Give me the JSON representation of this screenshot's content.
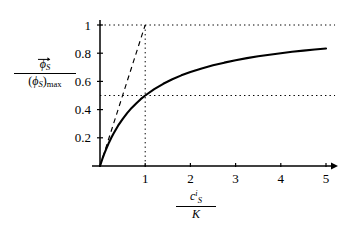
{
  "figure": {
    "background_color": "#ffffff",
    "ink_color": "#000000"
  },
  "axis_labels": {
    "y": {
      "numerator_symbol": "ϕ",
      "numerator_subscript": "S",
      "numerator_accent": "vector-arrow",
      "denominator_open": "(",
      "denominator_symbol": "ϕ",
      "denominator_subscript": "S",
      "denominator_close": ")",
      "denominator_sub": "max"
    },
    "x": {
      "numerator_symbol": "c",
      "numerator_subscript": "S",
      "numerator_superscript": "i",
      "denominator_symbol": "K"
    }
  },
  "chart_data": {
    "type": "line",
    "title": "",
    "xlabel": "c_S^i / K",
    "ylabel": "phi_S / (phi_S)_max",
    "xlim": [
      0,
      5.35
    ],
    "ylim": [
      0,
      1.06
    ],
    "grid": false,
    "legend": "none",
    "xticks": [
      1,
      2,
      3,
      4,
      5
    ],
    "xticklabels": [
      "1",
      "2",
      "3",
      "4",
      "5"
    ],
    "yticks": [
      0.2,
      0.4,
      0.6,
      0.8,
      1
    ],
    "yticklabels": [
      "0.2",
      "0.4",
      "0.6",
      "0.8",
      "1"
    ],
    "series": [
      {
        "name": "saturation-curve",
        "style": "solid",
        "formula": "y = x / (1 + x)",
        "x": [
          0,
          0.05,
          0.1,
          0.15,
          0.2,
          0.25,
          0.3,
          0.4,
          0.5,
          0.6,
          0.7,
          0.8,
          0.9,
          1.0,
          1.2,
          1.4,
          1.6,
          1.8,
          2.0,
          2.25,
          2.5,
          2.75,
          3.0,
          3.25,
          3.5,
          3.75,
          4.0,
          4.25,
          4.5,
          4.75,
          5.0
        ],
        "values": [
          0,
          0.048,
          0.091,
          0.13,
          0.167,
          0.2,
          0.231,
          0.286,
          0.333,
          0.375,
          0.412,
          0.444,
          0.474,
          0.5,
          0.545,
          0.583,
          0.615,
          0.643,
          0.667,
          0.692,
          0.714,
          0.733,
          0.75,
          0.765,
          0.778,
          0.789,
          0.8,
          0.81,
          0.818,
          0.826,
          0.833
        ]
      },
      {
        "name": "initial-slope-tangent",
        "style": "dashed",
        "formula": "y = x",
        "x": [
          0,
          1
        ],
        "values": [
          0,
          1
        ]
      }
    ],
    "guides": [
      {
        "name": "asymptote-line",
        "orientation": "horizontal",
        "value": 1,
        "style": "dotted",
        "from": 0,
        "to": 5.2
      },
      {
        "name": "half-max-line",
        "orientation": "horizontal",
        "value": 0.5,
        "style": "dotted",
        "from": 0,
        "to": 5.2
      },
      {
        "name": "half-saturation-line",
        "orientation": "vertical",
        "value": 1,
        "style": "dotted",
        "from": 0,
        "to": 1
      }
    ],
    "annotations": [
      {
        "name": "half-saturation-point",
        "x": 1,
        "y": 0.5
      }
    ]
  }
}
